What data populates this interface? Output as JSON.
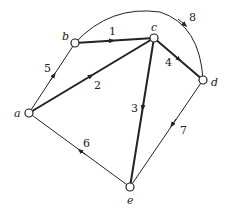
{
  "diagram": {
    "type": "directed-weighted-graph",
    "nodes": [
      {
        "id": "a",
        "label": "a",
        "x": 29,
        "y": 113
      },
      {
        "id": "b",
        "label": "b",
        "x": 75,
        "y": 43
      },
      {
        "id": "c",
        "label": "c",
        "x": 154,
        "y": 38
      },
      {
        "id": "d",
        "label": "d",
        "x": 203,
        "y": 80
      },
      {
        "id": "e",
        "label": "e",
        "x": 130,
        "y": 187
      }
    ],
    "edges": [
      {
        "from": "b",
        "to": "c",
        "weight": "1",
        "bold": true
      },
      {
        "from": "a",
        "to": "c",
        "weight": "2",
        "bold": true
      },
      {
        "from": "c",
        "to": "e",
        "weight": "3",
        "bold": true
      },
      {
        "from": "c",
        "to": "d",
        "weight": "4",
        "bold": true
      },
      {
        "from": "a",
        "to": "b",
        "weight": "5",
        "bold": false
      },
      {
        "from": "e",
        "to": "a",
        "weight": "6",
        "bold": false
      },
      {
        "from": "d",
        "to": "e",
        "weight": "7",
        "bold": false
      },
      {
        "from": "b",
        "to": "d",
        "weight": "8",
        "bold": false,
        "curved": true
      }
    ]
  }
}
